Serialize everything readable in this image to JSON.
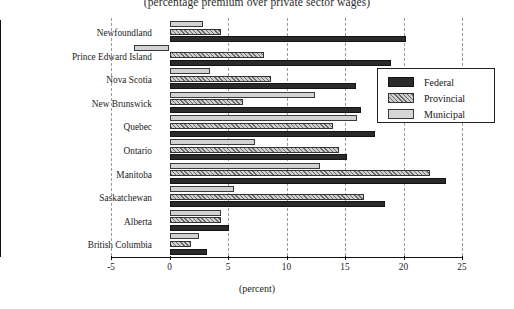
{
  "chart_data": {
    "type": "bar",
    "orientation": "horizontal",
    "title": "(percentage premium over private sector wages)",
    "xlabel": "(percent)",
    "ylabel": "",
    "xlim": [
      -5,
      25
    ],
    "xticks": [
      -5,
      0,
      5,
      10,
      15,
      20,
      25
    ],
    "xticklabels": [
      "-5",
      "0",
      "5",
      "10",
      "15",
      "20",
      "25"
    ],
    "grid": "vertical-dashed",
    "legend_position": "upper-right-inside",
    "categories": [
      "Newfoundland",
      "Prince Edward Island",
      "Nova Scotia",
      "New Brunswick",
      "Quebec",
      "Ontario",
      "Manitoba",
      "Saskatchewan",
      "Alberta",
      "British Columbia"
    ],
    "series": [
      {
        "name": "Federal",
        "color": "#2a2a2a",
        "values": [
          20.2,
          18.9,
          15.9,
          16.4,
          17.6,
          15.2,
          23.6,
          18.4,
          5.1,
          3.2
        ]
      },
      {
        "name": "Provincial",
        "color": "#cfcfcf",
        "values": [
          4.4,
          8.1,
          8.7,
          6.3,
          14.0,
          14.5,
          22.3,
          16.6,
          4.4,
          1.8
        ]
      },
      {
        "name": "Municipal",
        "color": "#d2d2d2",
        "values": [
          2.9,
          -3.0,
          3.5,
          12.4,
          16.0,
          7.3,
          12.9,
          5.5,
          4.4,
          2.5
        ]
      }
    ]
  },
  "legend": {
    "items": [
      {
        "label": "Federal"
      },
      {
        "label": "Provincial"
      },
      {
        "label": "Municipal"
      }
    ]
  }
}
